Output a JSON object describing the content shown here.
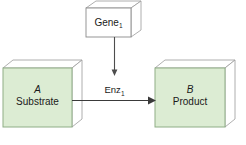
{
  "diagram": {
    "background_color": "#ffffff",
    "nodes": {
      "gene": {
        "label": "Gene",
        "subscript": "1",
        "fill_color": "#ffffff",
        "border_color": "#8a8a8a",
        "shape": "3d-box"
      },
      "substrate": {
        "italic_label": "A",
        "label": "Substrate",
        "fill_color": "#dcecd3",
        "border_color": "#8fae86",
        "shape": "3d-box"
      },
      "product": {
        "italic_label": "B",
        "label": "Product",
        "fill_color": "#dcecd3",
        "border_color": "#8fae86",
        "shape": "3d-box"
      }
    },
    "edges": {
      "gene_to_enzyme": {
        "label": "Enz",
        "subscript": "1",
        "direction": "down",
        "color": "#4d4d4d"
      },
      "substrate_to_product": {
        "label": "",
        "direction": "right",
        "color": "#3a3a3a"
      }
    }
  }
}
